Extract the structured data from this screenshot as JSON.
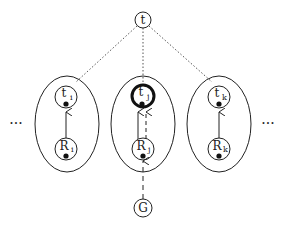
{
  "diagram": {
    "top_node": {
      "label": "t"
    },
    "bottom_node": {
      "label": "G"
    },
    "ellipsis_left": "···",
    "ellipsis_right": "···",
    "groups": [
      {
        "id": "i",
        "top_label": "t",
        "top_sub": "i",
        "bottom_label": "R",
        "bottom_sub": "i",
        "highlighted": false
      },
      {
        "id": "j",
        "top_label": "t",
        "top_sub": "j",
        "bottom_label": "R",
        "bottom_sub": "j",
        "highlighted": true
      },
      {
        "id": "k",
        "top_label": "t",
        "top_sub": "k",
        "bottom_label": "R",
        "bottom_sub": "k",
        "highlighted": false
      }
    ],
    "colors": {
      "stroke": "#222222",
      "dotted": "#555555",
      "background": "#ffffff"
    }
  }
}
